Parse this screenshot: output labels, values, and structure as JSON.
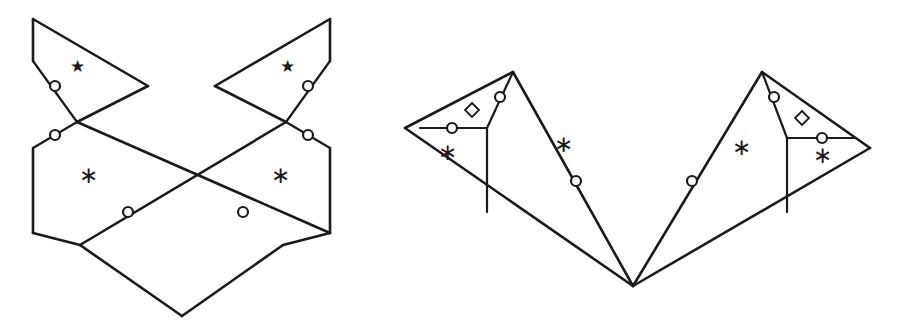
{
  "document": {
    "title": "Two polygonal surface diagrams with identification markers",
    "background_color": "#ffffff",
    "line_color": "#1a1a1a",
    "width": 907,
    "height": 336
  },
  "glyphs": {
    "asterisk": "∗",
    "star": "★",
    "diamond": "◇",
    "circle": "○"
  },
  "figures": [
    {
      "name": "left-figure",
      "label": "",
      "description": "Bow-tie / chevron polygon with two upper star triangles and two lower asterisk regions",
      "vertices": {
        "top_left": [
          33,
          19
        ],
        "top_right": [
          330,
          19
        ],
        "left_upper_notch": [
          33,
          61
        ],
        "right_upper_notch": [
          330,
          61
        ],
        "left_inner_tip": [
          148,
          86
        ],
        "right_inner_tip": [
          215,
          86
        ],
        "left_cross": [
          77,
          122
        ],
        "right_cross": [
          286,
          122
        ],
        "left_lower_notch": [
          33,
          148
        ],
        "right_lower_notch": [
          330,
          148
        ],
        "left_bottom": [
          33,
          233
        ],
        "right_bottom": [
          330,
          233
        ],
        "center_cross": [
          182,
          182
        ],
        "left_foot": [
          80,
          245
        ],
        "right_foot": [
          283,
          245
        ],
        "bottom_tip": [
          182,
          316
        ]
      },
      "markers": {
        "circles": [
          [
            55,
            86
          ],
          [
            55,
            135
          ],
          [
            308,
            86
          ],
          [
            308,
            135
          ],
          [
            128,
            212
          ],
          [
            243,
            212
          ]
        ],
        "diamonds": [],
        "stars": [
          [
            77,
            68
          ],
          [
            287,
            68
          ]
        ],
        "asterisks": [
          [
            88,
            178
          ],
          [
            280,
            178
          ]
        ]
      }
    },
    {
      "name": "right-figure",
      "label": "",
      "description": "Double-diamond polygon with four asterisk regions, two diamond markers and six circle markers",
      "vertices": {
        "far_left": [
          405,
          128
        ],
        "far_right": [
          870,
          148
        ],
        "left_apex": [
          513,
          72
        ],
        "right_apex": [
          762,
          72
        ],
        "center_cross": [
          637,
          147
        ],
        "bottom_tip": [
          633,
          286
        ],
        "left_ridge_bottom": [
          487,
          212
        ],
        "right_ridge_bottom": [
          787,
          212
        ],
        "left_horiz_start": [
          420,
          128
        ],
        "left_horiz_end": [
          487,
          128
        ],
        "right_horiz_start": [
          787,
          138
        ],
        "right_horiz_end": [
          855,
          138
        ]
      },
      "markers": {
        "circles": [
          [
            452,
            128
          ],
          [
            500,
            97
          ],
          [
            774,
            97
          ],
          [
            822,
            138
          ],
          [
            576,
            181
          ],
          [
            692,
            181
          ]
        ],
        "diamonds": [
          [
            472,
            110
          ],
          [
            802,
            118
          ]
        ],
        "stars": [],
        "asterisks": [
          [
            447,
            155
          ],
          [
            563,
            147
          ],
          [
            741,
            150
          ],
          [
            822,
            158
          ]
        ]
      }
    }
  ]
}
